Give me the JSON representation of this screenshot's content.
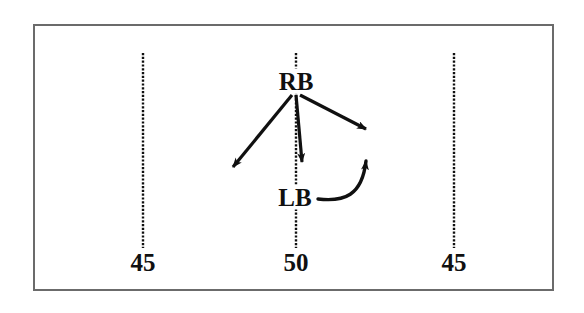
{
  "figure": {
    "background_color": "#ffffff",
    "frame_color": "#6b6b6b",
    "ink_color": "#101010"
  },
  "gridlines": [
    {
      "name": "left-gridline",
      "x": 143,
      "y_top": 53,
      "y_bottom": 248,
      "style": "dashed",
      "tick_label": "45"
    },
    {
      "name": "center-gridline",
      "x": 296,
      "y_top": 53,
      "y_bottom": 248,
      "style": "dashed",
      "tick_label": "50"
    },
    {
      "name": "right-gridline",
      "x": 454,
      "y_top": 53,
      "y_bottom": 248,
      "style": "dashed",
      "tick_label": "45"
    }
  ],
  "tick_labels": [
    {
      "text": "45",
      "x": 143,
      "y": 262
    },
    {
      "text": "50",
      "x": 296,
      "y": 262
    },
    {
      "text": "45",
      "x": 454,
      "y": 262
    }
  ],
  "nodes": [
    {
      "id": "RB",
      "label": "RB",
      "x": 296,
      "y": 81
    },
    {
      "id": "LB",
      "label": "LB",
      "x": 295,
      "y": 197
    }
  ],
  "arrows": [
    {
      "name": "rb-arrow-down-left",
      "from": "RB",
      "type": "straight",
      "x1": 292,
      "y1": 95,
      "x2": 228,
      "y2": 172
    },
    {
      "name": "rb-arrow-down",
      "from": "RB",
      "type": "straight",
      "x1": 296,
      "y1": 95,
      "x2": 303,
      "y2": 168
    },
    {
      "name": "rb-arrow-down-right",
      "from": "RB",
      "type": "straight",
      "x1": 300,
      "y1": 95,
      "x2": 372,
      "y2": 133
    },
    {
      "name": "lb-arrow-curved-up",
      "from": "LB",
      "type": "curved",
      "x1": 318,
      "y1": 199,
      "cx": 362,
      "cy": 205,
      "x2": 367,
      "y2": 154
    }
  ]
}
